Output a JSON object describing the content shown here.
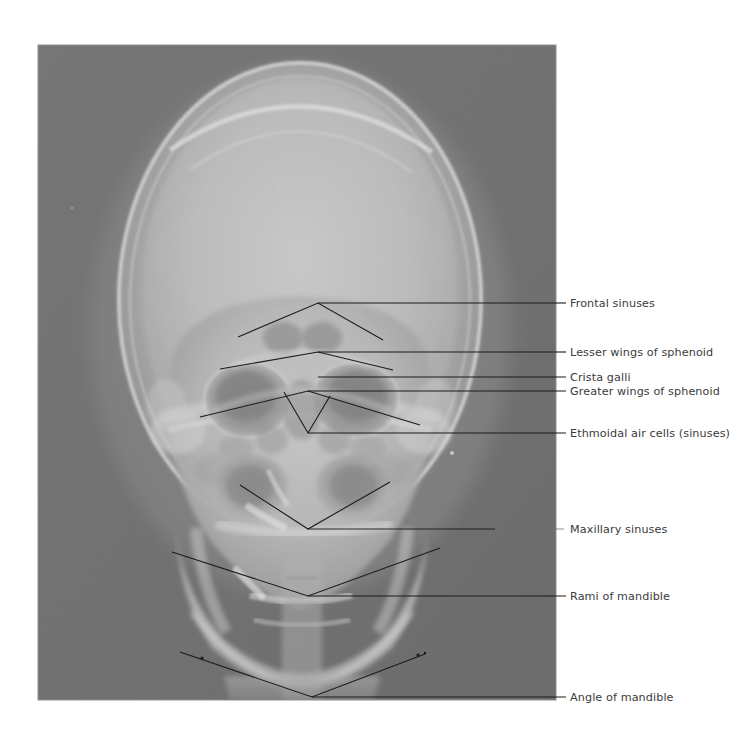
{
  "figure": {
    "kind": "annotated-radiograph",
    "page_background": "#ffffff",
    "radiograph": {
      "x": 38,
      "y": 45,
      "width": 518,
      "height": 655,
      "background_tone": "#6e6e6e",
      "border_color": "#8a8a8a"
    },
    "annotation": {
      "line_color": "#1b1b1b",
      "line_width": 1.1,
      "text_color": "#3b3b3b",
      "font_size_px": 11.2,
      "dash_length_px": 14
    }
  },
  "labels": [
    {
      "id": "frontal-sinuses",
      "text": "Frontal sinuses",
      "text_x": 570,
      "text_y": 307,
      "rule_y": 303,
      "rule_x1": 556,
      "rule_x2": 566,
      "leader": "M318,303 L556,303",
      "pointer": "M238,337 L318,303 L383,340"
    },
    {
      "id": "lesser-wings-of-sphenoid",
      "text": "Lesser wings of sphenoid",
      "text_x": 570,
      "text_y": 356,
      "rule_y": 352,
      "rule_x1": 556,
      "rule_x2": 566,
      "leader": "M318,352 L556,352",
      "pointer": "M220,369 L318,352 L393,370"
    },
    {
      "id": "crista-galli",
      "text": "Crista galli",
      "text_x": 570,
      "text_y": 381,
      "rule_y": 377,
      "rule_x1": 556,
      "rule_x2": 566,
      "leader": "M318,377 L556,377",
      "pointer": ""
    },
    {
      "id": "greater-wings-of-sphenoid",
      "text": "Greater wings of sphenoid",
      "text_x": 570,
      "text_y": 395,
      "rule_y": 391,
      "rule_x1": 556,
      "rule_x2": 566,
      "leader": "M308,391 L556,391",
      "pointer": "M200,417 L308,391 L420,425"
    },
    {
      "id": "ethmoidal-air-cells",
      "text": "Ethmoidal air cells (sinuses)",
      "text_x": 570,
      "text_y": 437,
      "rule_y": 433,
      "rule_x1": 556,
      "rule_x2": 566,
      "leader": "M308,433 L556,433",
      "pointer": "M284,392 L308,433 L330,396"
    },
    {
      "id": "maxillary-sinuses",
      "text": "Maxillary sinuses",
      "text_x": 570,
      "text_y": 533,
      "rule_y": 529,
      "rule_x1": 556,
      "rule_x2": 566,
      "leader": "M308,529 L556,529",
      "pointer": "M240,485 L308,529 L390,482"
    },
    {
      "id": "rami-of-mandible",
      "text": "Rami of mandible",
      "text_x": 570,
      "text_y": 600,
      "rule_y": 596,
      "rule_x1": 556,
      "rule_x2": 566,
      "leader": "M308,596 L556,596",
      "pointer": "M172,552 L308,596 L440,548"
    },
    {
      "id": "angle-of-mandible",
      "text": "Angle of mandible",
      "text_x": 570,
      "text_y": 701,
      "rule_y": 697,
      "rule_x1": 556,
      "rule_x2": 566,
      "leader": "M312,697 L556,697",
      "pointer": "M180,652 L312,697 L425,654"
    }
  ]
}
